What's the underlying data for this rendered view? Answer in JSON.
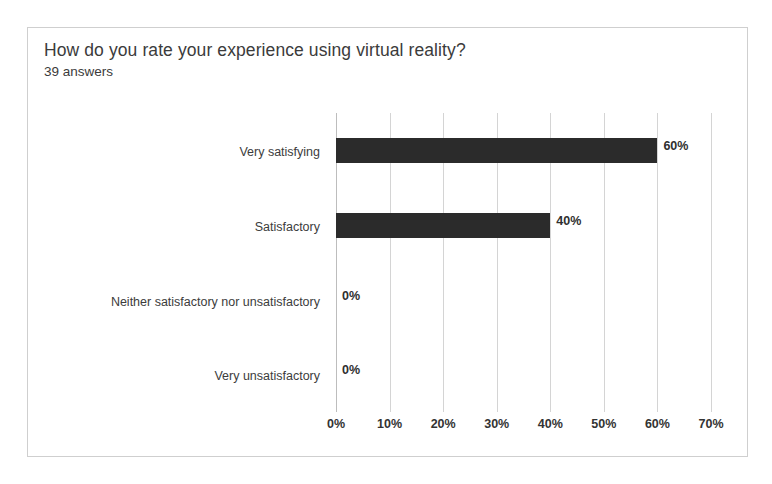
{
  "chart_data": {
    "type": "bar",
    "orientation": "horizontal",
    "title": "How do you rate your experience using virtual reality?",
    "subtitle": "39 answers",
    "categories": [
      "Very satisfying",
      "Satisfactory",
      "Neither satisfactory nor unsatisfactory",
      "Very unsatisfactory"
    ],
    "values": [
      60,
      40,
      0,
      0
    ],
    "data_labels": [
      "60%",
      "40%",
      "0%",
      "0%"
    ],
    "xlabel": "",
    "ylabel": "",
    "xlim": [
      0,
      70
    ],
    "x_ticks": [
      0,
      10,
      20,
      30,
      40,
      50,
      60,
      70
    ],
    "x_tick_labels": [
      "0%",
      "10%",
      "20%",
      "30%",
      "40%",
      "50%",
      "60%",
      "70%"
    ],
    "grid": "vertical",
    "legend": "none",
    "bar_color": "#2b2b2b",
    "gridline_color": "#d4d4d4",
    "background_color": "#ffffff",
    "border_color": "#cfcfcf",
    "text_color": "#3c3c3c"
  }
}
